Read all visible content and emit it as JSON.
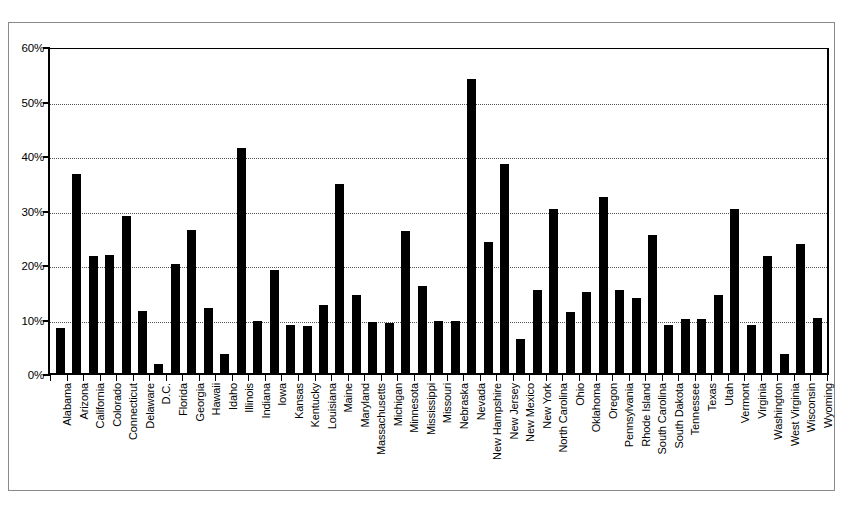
{
  "chart_data": {
    "type": "bar",
    "title": "",
    "subtitle": "",
    "xlabel": "",
    "ylabel": "",
    "ylim": [
      0,
      60
    ],
    "ytick_labels": [
      "0%",
      "10%",
      "20%",
      "30%",
      "40%",
      "50%",
      "60%"
    ],
    "ytick_values": [
      0,
      10,
      20,
      30,
      40,
      50,
      60
    ],
    "grid": true,
    "legend": null,
    "legend_position": "none",
    "bar_color": "#000000",
    "background_color": "#FFFFFF",
    "axis_color": "#000000",
    "gridline_color": "#555555",
    "value_unit": "%",
    "categories": [
      "Alabama",
      "Arizona",
      "California",
      "Colorado",
      "Connecticut",
      "Delaware",
      "D.C.",
      "Florida",
      "Georgia",
      "Hawaii",
      "Idaho",
      "Illinois",
      "Indiana",
      "Iowa",
      "Kansas",
      "Kentucky",
      "Louisiana",
      "Maine",
      "Maryland",
      "Massachusetts",
      "Michigan",
      "Minnesota",
      "Mississippi",
      "Missouri",
      "Nebraska",
      "Nevada",
      "New Hampshire",
      "New Jersey",
      "New Mexico",
      "New York",
      "North Carolina",
      "Ohio",
      "Oklahoma",
      "Oregon",
      "Pennsylvania",
      "Rhode Island",
      "South Carolina",
      "South Dakota",
      "Tennessee",
      "Texas",
      "Utah",
      "Vermont",
      "Virginia",
      "Washington",
      "West Virginia",
      "Wisconsin",
      "Wyoming"
    ],
    "values": [
      8.2,
      36.5,
      21.5,
      21.6,
      28.8,
      11.4,
      1.7,
      20.0,
      26.2,
      12.0,
      3.4,
      41.3,
      9.6,
      18.9,
      8.8,
      8.7,
      12.4,
      34.6,
      14.3,
      9.3,
      9.1,
      26.0,
      15.9,
      9.5,
      9.5,
      54.0,
      24.1,
      38.4,
      6.2,
      15.2,
      30.1,
      11.2,
      14.8,
      32.3,
      15.3,
      13.8,
      25.4,
      8.9,
      9.9,
      9.9,
      14.4,
      30.1,
      8.9,
      21.4,
      3.4,
      23.7,
      10.1
    ]
  }
}
